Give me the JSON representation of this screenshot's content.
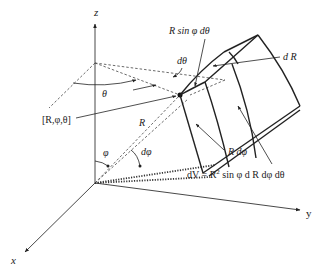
{
  "diagram": {
    "axes": {
      "z_label": "z",
      "x_label": "x",
      "y_label": "y"
    },
    "labels": {
      "point": "[R,φ,θ]",
      "theta": "θ",
      "d_theta": "dθ",
      "phi": "φ",
      "d_phi": "dφ",
      "radius": "R",
      "arc_theta": "R  sin φ dθ",
      "arc_phi": "R dφ",
      "dR": "d R",
      "volume_prefix": "dV = R",
      "volume_exp": "2",
      "volume_suffix": " sin φ d R dφ dθ"
    },
    "colors": {
      "line": "#222222",
      "background": "#ffffff"
    }
  }
}
